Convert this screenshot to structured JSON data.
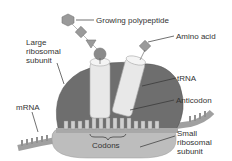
{
  "labels": {
    "growing_polypeptide": "Growing polypeptide",
    "amino_acid": "Amino acid",
    "large_subunit": "Large\nribosomal\nsubunit",
    "trna": "tRNA",
    "mrna": "mRNA",
    "anticodon": "Anticodon",
    "codons": "Codons",
    "small_subunit": "Small\nribosomal\nsubunit"
  },
  "colors": {
    "large_subunit": "#6e6e6e",
    "small_subunit": "#b8b8b8",
    "trna": "#e6e6e6",
    "amino_acid": "#8a8a8a",
    "mrna": "#aaaaaa",
    "text": "#333333"
  }
}
